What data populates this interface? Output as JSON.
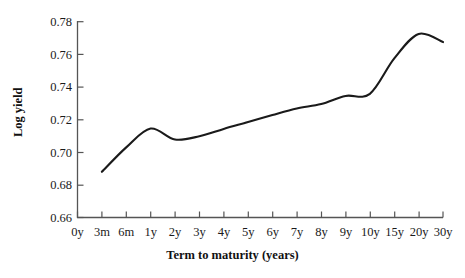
{
  "chart_data": {
    "type": "line",
    "title": "",
    "xlabel": "Term to maturity (years)",
    "ylabel": "Log yield",
    "categories": [
      "0y",
      "3m",
      "6m",
      "1y",
      "2y",
      "3y",
      "4y",
      "5y",
      "6y",
      "7y",
      "8y",
      "9y",
      "10y",
      "15y",
      "20y",
      "30y"
    ],
    "values": [
      null,
      0.688,
      0.703,
      0.7145,
      0.7078,
      0.7098,
      0.7143,
      0.7185,
      0.7228,
      0.7268,
      0.7295,
      0.7345,
      0.7358,
      0.7575,
      0.7725,
      0.7675
    ],
    "series": [
      {
        "name": "Log yield",
        "values": [
          null,
          0.688,
          0.703,
          0.7145,
          0.7078,
          0.7098,
          0.7143,
          0.7185,
          0.7228,
          0.7268,
          0.7295,
          0.7345,
          0.7358,
          0.7575,
          0.7725,
          0.7675
        ]
      }
    ],
    "ylim": [
      0.66,
      0.78
    ],
    "yticks": [
      0.66,
      0.68,
      0.7,
      0.72,
      0.74,
      0.76,
      0.78
    ],
    "ytick_labels": [
      "0.66",
      "0.68",
      "0.70",
      "0.72",
      "0.74",
      "0.76",
      "0.78"
    ],
    "grid": false,
    "legend": false,
    "legend_position": "none",
    "line_color": "#1a1a1a",
    "axis_color": "#555555",
    "background_color": "#ffffff"
  },
  "axes": {
    "y_title": "Log yield",
    "x_title": "Term to maturity (years)"
  }
}
